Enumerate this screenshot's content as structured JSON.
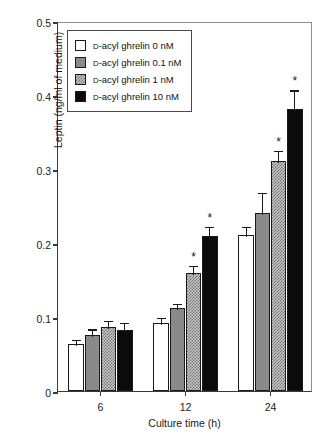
{
  "chart_data": {
    "type": "bar",
    "title": "",
    "xlabel": "Culture time (h)",
    "ylabel": "Leptin (ng/ml of medium)",
    "categories": [
      "6",
      "12",
      "24"
    ],
    "ylim": [
      0,
      0.5
    ],
    "yticks": [
      "0",
      "0.1",
      "0.2",
      "0.3",
      "0.4",
      "0.5"
    ],
    "ytick_values": [
      0,
      0.1,
      0.2,
      0.3,
      0.4,
      0.5
    ],
    "grid": false,
    "legend_position": "top-left",
    "significance_marker": "*",
    "series": [
      {
        "name": "D-acyl ghrelin 0 nM",
        "swatch": "white",
        "color": "#ffffff",
        "values": [
          0.064,
          0.092,
          0.211
        ],
        "errors": [
          0.008,
          0.009,
          0.014
        ],
        "significant": [
          false,
          false,
          false
        ]
      },
      {
        "name": "D-acyl ghrelin 0.1 nM",
        "swatch": "gray",
        "color": "#8a8a8a",
        "values": [
          0.076,
          0.112,
          0.24
        ],
        "errors": [
          0.01,
          0.008,
          0.03
        ],
        "significant": [
          false,
          false,
          false
        ]
      },
      {
        "name": "D-acyl ghrelin 1 nM",
        "swatch": "checker",
        "color": "#c9c9c9",
        "values": [
          0.087,
          0.16,
          0.311
        ],
        "errors": [
          0.01,
          0.012,
          0.016
        ],
        "significant": [
          false,
          true,
          true
        ]
      },
      {
        "name": "D-acyl ghrelin 10 nM",
        "swatch": "black",
        "color": "#0b0b0b",
        "values": [
          0.083,
          0.21,
          0.381
        ],
        "errors": [
          0.012,
          0.014,
          0.028
        ],
        "significant": [
          false,
          true,
          true
        ]
      }
    ]
  },
  "legend": {
    "items": [
      {
        "prefix": "D",
        "label": "-acyl ghrelin 0 nM"
      },
      {
        "prefix": "D",
        "label": "-acyl ghrelin 0.1 nM"
      },
      {
        "prefix": "D",
        "label": "-acyl ghrelin 1 nM"
      },
      {
        "prefix": "D",
        "label": "-acyl ghrelin 10 nM"
      }
    ]
  }
}
